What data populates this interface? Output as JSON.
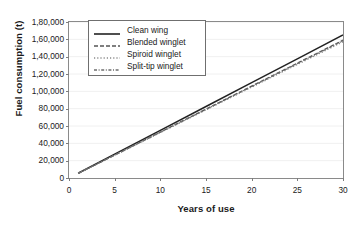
{
  "chart_data": {
    "type": "line",
    "title": "",
    "xlabel": "Years of use",
    "ylabel": "Fuel consumption (t)",
    "xlim": [
      0,
      30
    ],
    "ylim": [
      0,
      180000
    ],
    "grid": true,
    "legend_position": "top-left-inside",
    "x_ticks": [
      "0",
      "5",
      "10",
      "15",
      "20",
      "25",
      "30"
    ],
    "x_tick_values": [
      0,
      5,
      10,
      15,
      20,
      25,
      30
    ],
    "y_ticks": [
      "0",
      "20,000",
      "40,000",
      "60,000",
      "80,000",
      "1,00,000",
      "1,20,000",
      "1,40,000",
      "1,60,000",
      "1,80,000"
    ],
    "y_tick_values": [
      0,
      20000,
      40000,
      60000,
      80000,
      100000,
      120000,
      140000,
      160000,
      180000
    ],
    "x": [
      1,
      5,
      10,
      15,
      20,
      25,
      30
    ],
    "series": [
      {
        "name": "Clean wing",
        "style": "solid",
        "color": "#222222",
        "values": [
          5500,
          27500,
          55000,
          82500,
          110000,
          137500,
          165000
        ]
      },
      {
        "name": "Blended winglet",
        "style": "dashed",
        "color": "#555555",
        "values": [
          5300,
          26500,
          53000,
          79500,
          106000,
          132500,
          159000
        ]
      },
      {
        "name": "Spiroid winglet",
        "style": "dotted",
        "color": "#8a8a8a",
        "values": [
          5250,
          26200,
          52400,
          78600,
          104800,
          131000,
          157200
        ]
      },
      {
        "name": "Split-tip winglet",
        "style": "dashdot",
        "color": "#6e6e6e",
        "values": [
          5280,
          26400,
          52800,
          79200,
          105600,
          132000,
          158400
        ]
      }
    ]
  }
}
